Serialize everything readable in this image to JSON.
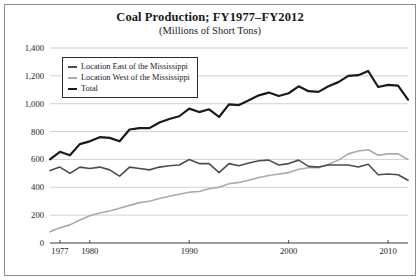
{
  "chart_data": {
    "type": "line",
    "title": "Coal Production; FY1977–FY2012",
    "subtitle": "(Millions of Short Tons)",
    "xlabel": "",
    "ylabel": "",
    "xlim": [
      1976,
      2012
    ],
    "ylim": [
      0,
      1400
    ],
    "ytick_labels": [
      "0",
      "200",
      "400",
      "600",
      "800",
      "1,000",
      "1,200",
      "1,400"
    ],
    "ytick_values": [
      0,
      200,
      400,
      600,
      800,
      1000,
      1200,
      1400
    ],
    "xtick_labels": [
      "1977",
      "1980",
      "1990",
      "2000",
      "2010"
    ],
    "xtick_values": [
      1977,
      1980,
      1990,
      2000,
      2010
    ],
    "grid": true,
    "legend_position": "upper-left-inside",
    "x": [
      1976,
      1977,
      1978,
      1979,
      1980,
      1981,
      1982,
      1983,
      1984,
      1985,
      1986,
      1987,
      1988,
      1989,
      1990,
      1991,
      1992,
      1993,
      1994,
      1995,
      1996,
      1997,
      1998,
      1999,
      2000,
      2001,
      2002,
      2003,
      2004,
      2005,
      2006,
      2007,
      2008,
      2009,
      2010,
      2011,
      2012
    ],
    "series": [
      {
        "name": "Location East of the Mississippi",
        "color": "#4d4d4d",
        "width": 1.6,
        "values": [
          520,
          545,
          500,
          545,
          535,
          545,
          525,
          480,
          545,
          535,
          525,
          545,
          555,
          560,
          600,
          570,
          570,
          505,
          570,
          555,
          575,
          590,
          595,
          560,
          570,
          595,
          550,
          545,
          560,
          560,
          560,
          545,
          565,
          490,
          495,
          490,
          450
        ]
      },
      {
        "name": "Location West of the Mississippi",
        "color": "#aaaaaa",
        "width": 1.6,
        "values": [
          80,
          110,
          130,
          165,
          195,
          215,
          230,
          250,
          270,
          290,
          300,
          320,
          335,
          350,
          365,
          370,
          390,
          400,
          425,
          435,
          450,
          470,
          485,
          495,
          505,
          530,
          540,
          540,
          565,
          595,
          640,
          660,
          670,
          630,
          640,
          640,
          600
        ]
      },
      {
        "name": "Total",
        "color": "#1a1a1a",
        "width": 2.2,
        "values": [
          600,
          655,
          630,
          710,
          730,
          760,
          755,
          730,
          815,
          825,
          825,
          865,
          890,
          910,
          965,
          940,
          960,
          905,
          995,
          990,
          1025,
          1060,
          1080,
          1055,
          1075,
          1125,
          1090,
          1085,
          1125,
          1155,
          1200,
          1205,
          1235,
          1120,
          1135,
          1130,
          1030
        ]
      }
    ]
  },
  "legend": {
    "items": [
      {
        "label": "Location East of the Mississippi",
        "color": "#4d4d4d",
        "thickness": 2
      },
      {
        "label": "Location West of the Mississippi",
        "color": "#aaaaaa",
        "thickness": 2
      },
      {
        "label": "Total",
        "color": "#1a1a1a",
        "thickness": 2.6
      }
    ]
  }
}
